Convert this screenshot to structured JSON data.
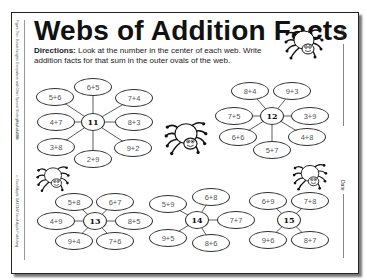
{
  "worksheet": {
    "title": "Webs of Addition Facts",
    "directions_label": "Directions:",
    "directions_text": " Look at the number in the center of each web. Write addition facts for that sum in the outer ovals of the web.",
    "name_label": "Name",
    "date_label": "Date",
    "side_text_top": "Figure This: Bonus Insights Everywhere and Other Special Strategies 2 ©2000",
    "side_text_mid": "Reproducible",
    "side_text_bottom": "©Good Apple GA13148 Good Apple Publishing"
  },
  "webs": [
    {
      "center": "11",
      "cx": 93,
      "cy": 122,
      "ovals": [
        {
          "label": "6+5",
          "x": 93,
          "y": 87
        },
        {
          "label": "5+6",
          "x": 55,
          "y": 97
        },
        {
          "label": "7+4",
          "x": 134,
          "y": 98
        },
        {
          "label": "4+7",
          "x": 56,
          "y": 122
        },
        {
          "label": "8+3",
          "x": 134,
          "y": 122
        },
        {
          "label": "3+8",
          "x": 56,
          "y": 147
        },
        {
          "label": "9+2",
          "x": 133,
          "y": 148
        },
        {
          "label": "2+9",
          "x": 93,
          "y": 159
        }
      ]
    },
    {
      "center": "12",
      "cx": 272,
      "cy": 116,
      "ovals": [
        {
          "label": "8+4",
          "x": 250,
          "y": 91
        },
        {
          "label": "9+3",
          "x": 292,
          "y": 91
        },
        {
          "label": "7+5",
          "x": 234,
          "y": 116
        },
        {
          "label": "3+9",
          "x": 310,
          "y": 116
        },
        {
          "label": "6+6",
          "x": 238,
          "y": 137
        },
        {
          "label": "4+8",
          "x": 307,
          "y": 137
        },
        {
          "label": "5+7",
          "x": 272,
          "y": 150
        }
      ]
    },
    {
      "center": "13",
      "cx": 95,
      "cy": 221,
      "ovals": [
        {
          "label": "5+8",
          "x": 74,
          "y": 202
        },
        {
          "label": "6+7",
          "x": 115,
          "y": 202
        },
        {
          "label": "4+9",
          "x": 56,
          "y": 221
        },
        {
          "label": "8+5",
          "x": 134,
          "y": 221
        },
        {
          "label": "9+4",
          "x": 74,
          "y": 241
        },
        {
          "label": "7+6",
          "x": 115,
          "y": 241
        }
      ]
    },
    {
      "center": "14",
      "cx": 197,
      "cy": 220,
      "ovals": [
        {
          "label": "5+9",
          "x": 168,
          "y": 204
        },
        {
          "label": "6+8",
          "x": 211,
          "y": 197
        },
        {
          "label": "7+7",
          "x": 236,
          "y": 220
        },
        {
          "label": "9+5",
          "x": 168,
          "y": 238
        },
        {
          "label": "8+6",
          "x": 211,
          "y": 243
        }
      ]
    },
    {
      "center": "15",
      "cx": 289,
      "cy": 220,
      "ovals": [
        {
          "label": "6+9",
          "x": 268,
          "y": 201
        },
        {
          "label": "7+8",
          "x": 310,
          "y": 201
        },
        {
          "label": "9+6",
          "x": 268,
          "y": 240
        },
        {
          "label": "8+7",
          "x": 310,
          "y": 240
        }
      ]
    }
  ],
  "spiders": [
    {
      "x": 284,
      "y": 26,
      "w": 40,
      "h": 34
    },
    {
      "x": 164,
      "y": 118,
      "w": 44,
      "h": 38
    },
    {
      "x": 36,
      "y": 163,
      "w": 34,
      "h": 30
    },
    {
      "x": 292,
      "y": 161,
      "w": 36,
      "h": 30
    }
  ]
}
